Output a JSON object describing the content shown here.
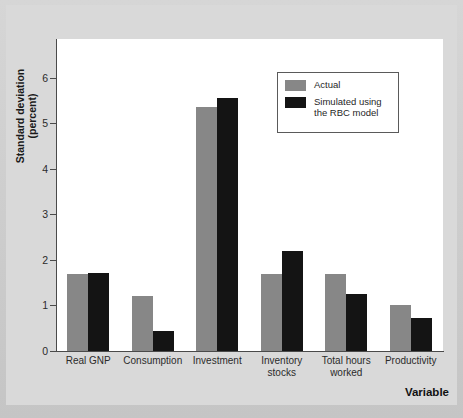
{
  "chart_data": {
    "type": "bar",
    "title": "",
    "xlabel": "Variable",
    "ylabel": "Standard deviation\n(percent)",
    "categories": [
      "Real GNP",
      "Consumption",
      "Investment",
      "Inventory\nstocks",
      "Total hours\nworked",
      "Productivity"
    ],
    "series": [
      {
        "name": "Actual",
        "color": "#878787",
        "values": [
          1.7,
          1.2,
          5.35,
          1.7,
          1.7,
          1.0
        ]
      },
      {
        "name": "Simulated using\nthe RBC model",
        "color": "#141414",
        "values": [
          1.71,
          0.44,
          5.55,
          2.2,
          1.25,
          0.72
        ]
      }
    ],
    "ylim": [
      0,
      6.85
    ],
    "yticks": [
      0,
      1,
      2,
      3,
      4,
      5,
      6
    ],
    "ytick_labels": [
      "0",
      "1",
      "2",
      "3",
      "4",
      "5",
      "6"
    ],
    "grid": false,
    "legend_position": "top-right"
  },
  "legend": {
    "entries": [
      {
        "label": "Actual",
        "color": "#878787"
      },
      {
        "label": "Simulated using\nthe RBC model",
        "color": "#141414"
      }
    ]
  },
  "axes": {
    "y_title": "Standard deviation\n(percent)",
    "x_title": "Variable"
  },
  "colors": {
    "actual": "#878787",
    "simulated": "#141414",
    "axis": "#4a4a4a",
    "plot_background": "#ffffff",
    "page_background": "#d9d9d9"
  }
}
